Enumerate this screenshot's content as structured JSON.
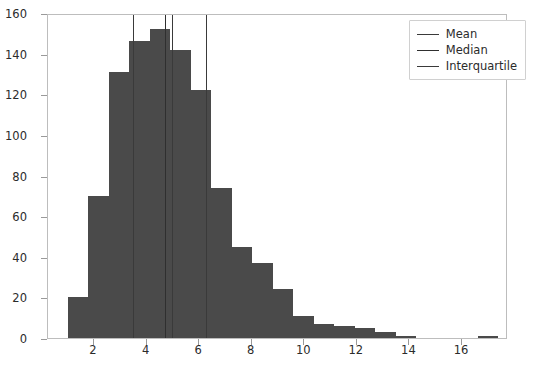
{
  "chart_data": {
    "type": "bar",
    "title": "",
    "xlabel": "",
    "ylabel": "",
    "xlim": [
      0.25,
      17.75
    ],
    "ylim": [
      0,
      160
    ],
    "grid": false,
    "bar_color": "#4a4a4a",
    "legend_position": "upper right",
    "xticks": [
      2,
      4,
      6,
      8,
      10,
      12,
      14,
      16
    ],
    "yticks": [
      0,
      20,
      40,
      60,
      80,
      100,
      120,
      140,
      160
    ],
    "bin_width": 0.78,
    "bin_starts": [
      1.0,
      1.78,
      2.56,
      3.34,
      4.12,
      4.9,
      5.68,
      6.46,
      7.24,
      8.02,
      8.8,
      9.58,
      10.36,
      11.14,
      11.92,
      12.7,
      13.48,
      14.26,
      15.04,
      15.82,
      16.6
    ],
    "values": [
      20,
      70,
      131,
      146,
      152,
      142,
      122,
      74,
      45,
      37,
      24,
      11,
      7,
      6,
      5,
      3,
      1,
      0,
      0,
      0,
      1
    ],
    "series": [
      {
        "name": "Histogram",
        "values": [
          20,
          70,
          131,
          146,
          152,
          142,
          122,
          74,
          45,
          37,
          24,
          11,
          7,
          6,
          5,
          3,
          1,
          0,
          0,
          0,
          1
        ]
      }
    ],
    "reference_lines": [
      {
        "name": "Mean",
        "x": 4.95,
        "color": "#3a3a3a"
      },
      {
        "name": "Median",
        "x": 4.72,
        "color": "#2f2f2f"
      },
      {
        "name": "Interquartile",
        "x": 3.5,
        "color": "#3a3a3a"
      },
      {
        "name": "Interquartile",
        "x": 6.25,
        "color": "#3a3a3a"
      }
    ],
    "legend": [
      {
        "label": "Mean",
        "color": "#3a3a3a"
      },
      {
        "label": "Median",
        "color": "#2f2f2f"
      },
      {
        "label": "Interquartile",
        "color": "#3a3a3a"
      }
    ]
  }
}
